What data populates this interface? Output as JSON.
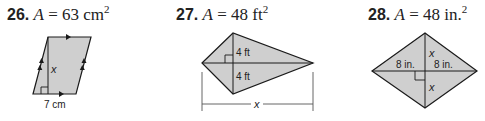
{
  "problems": [
    {
      "number": "26.",
      "area_var": "A",
      "equals": "=",
      "area_value": "63",
      "area_unit": "cm",
      "exponent": "2",
      "figure": "parallelogram",
      "labels": {
        "height": "x",
        "base": "7 cm"
      }
    },
    {
      "number": "27.",
      "area_var": "A",
      "equals": "=",
      "area_value": "48",
      "area_unit": "ft",
      "exponent": "2",
      "figure": "kite",
      "labels": {
        "upper_half": "4 ft",
        "lower_half": "4 ft",
        "width": "x"
      }
    },
    {
      "number": "28.",
      "area_var": "A",
      "equals": "=",
      "area_value": "48",
      "area_unit": "in.",
      "exponent": "2",
      "figure": "rhombus",
      "labels": {
        "left_half": "8 in.",
        "right_half": "8 in.",
        "upper_half": "x",
        "lower_half": "x"
      }
    }
  ],
  "colors": {
    "fill": "#cfcfcf",
    "stroke": "#1a1a1a",
    "text": "#222222"
  }
}
